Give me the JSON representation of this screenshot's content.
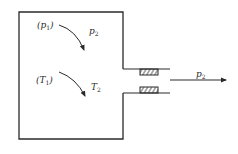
{
  "diagram": {
    "title": "",
    "labels": {
      "p_initial": {
        "base": "p",
        "sub": "1",
        "paren_open": "(",
        "paren_close": ")"
      },
      "p_final": {
        "base": "p",
        "sub": "2"
      },
      "T_initial": {
        "base": "T",
        "sub": "1",
        "paren_open": "(",
        "paren_close": ")"
      },
      "T_final": {
        "base": "T",
        "sub": "2"
      },
      "outlet_pressure": {
        "base": "p",
        "sub": "2"
      }
    },
    "colors": {
      "stroke": "#2a2a2a",
      "background": "#ffffff"
    }
  }
}
